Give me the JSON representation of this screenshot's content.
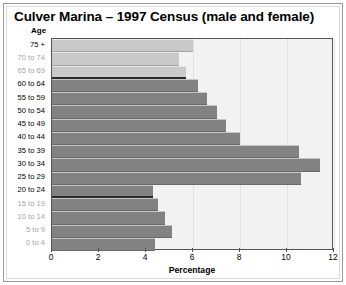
{
  "title": "Culver Marina – 1997 Census (male and female)",
  "axes": {
    "y_title": "Age",
    "x_title": "Percentage"
  },
  "colors": {
    "bar_light": "#c9c9c9",
    "bar_dark": "#828282",
    "plot_background": "#f2f2f2",
    "plot_border": "#555555",
    "label_faded": "#a6a6a6",
    "text": "#000000"
  },
  "chart_data": {
    "type": "bar",
    "orientation": "horizontal",
    "title": "Culver Marina – 1997 Census (male and female)",
    "xlabel": "Percentage",
    "ylabel": "Age",
    "xlim": [
      0,
      12
    ],
    "xticks": [
      0,
      2,
      4,
      6,
      8,
      10,
      12
    ],
    "xtick_labels": [
      "0",
      "2",
      "4",
      "6",
      "8",
      "10",
      "12"
    ],
    "grid": true,
    "legend": "none",
    "categories": [
      "75 +",
      "70 to 74",
      "65 to 69",
      "60 to 64",
      "55 to 59",
      "50 to 54",
      "45 to 49",
      "40 to 44",
      "35 to 39",
      "30 to 34",
      "25 to 29",
      "20 to 24",
      "15 to 19",
      "10 to 14",
      "5 to 9",
      "0 to 4"
    ],
    "values": [
      6.0,
      5.4,
      5.7,
      6.2,
      6.6,
      7.0,
      7.4,
      8.0,
      10.5,
      11.4,
      10.6,
      4.3,
      4.5,
      4.8,
      5.1,
      4.4
    ],
    "bar_shade": [
      "light",
      "light",
      "light",
      "dark",
      "dark",
      "dark",
      "dark",
      "dark",
      "dark",
      "dark",
      "dark",
      "dark",
      "dark",
      "dark",
      "dark",
      "dark"
    ],
    "label_muted": [
      false,
      true,
      true,
      false,
      false,
      false,
      false,
      false,
      false,
      false,
      false,
      false,
      true,
      true,
      true,
      true
    ]
  }
}
